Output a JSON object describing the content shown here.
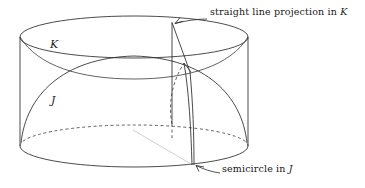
{
  "figure": {
    "type": "geometric-diagram",
    "background_color": "#ffffff",
    "line_color": "#2b2b2b",
    "faint_line_color": "#c9c9c9",
    "solids": [
      {
        "name": "cylinder",
        "label": "K",
        "label_style": "italic",
        "top_ellipse": {
          "cx": 134,
          "cy": 37,
          "rx": 114,
          "ry": 21
        },
        "bottom_ellipse": {
          "cx": 134,
          "cy": 146,
          "rx": 114,
          "ry": 21
        },
        "left_side_x": 20,
        "right_side_x": 248,
        "back_half_dashed": true
      },
      {
        "name": "dome",
        "label": "J",
        "label_style": "italic",
        "description": "hemispherical cap inscribed in the cylinder"
      }
    ],
    "curves": [
      {
        "name": "straight-line-projection",
        "style": "solid",
        "located_in": "K"
      },
      {
        "name": "semicircle",
        "style": "solid",
        "located_in": "J"
      },
      {
        "name": "hidden-semicircle-back",
        "style": "dashed"
      }
    ],
    "labels": {
      "cylinder_label": "K",
      "dome_label": "J"
    }
  },
  "annotations": {
    "top": {
      "text_before": "straight line projection in",
      "symbol": "K",
      "arrow": "points down-left to the apex of the straight line projection"
    },
    "bottom": {
      "text_before": "semicircle in",
      "symbol": "J",
      "arrow": "points up-left to the base of the semicircle"
    }
  }
}
